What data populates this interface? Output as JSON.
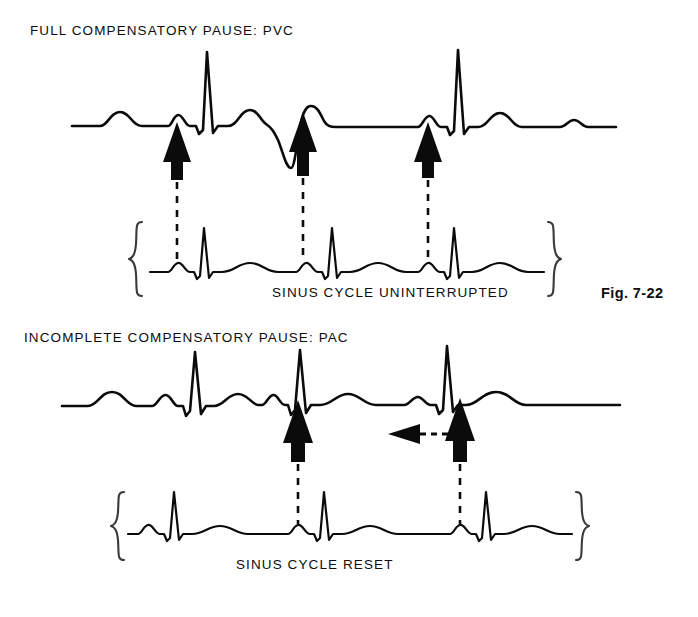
{
  "figure": {
    "caption": "Fig. 7-22",
    "background_color": "#ffffff",
    "ink_color": "#0b0b0b"
  },
  "panels": [
    {
      "id": "pvc-panel",
      "heading": "FULL COMPENSATORY PAUSE: PVC",
      "strip_label": "SINUS CYCLE UNINTERRUPTED",
      "arrow_count": 3,
      "has_braces": true
    },
    {
      "id": "pac-panel",
      "heading": "INCOMPLETE COMPENSATORY PAUSE: PAC",
      "strip_label": "SINUS CYCLE  RESET",
      "arrow_count": 2,
      "has_braces": true,
      "reset_arrow": "leftward-shift-arrow"
    }
  ]
}
